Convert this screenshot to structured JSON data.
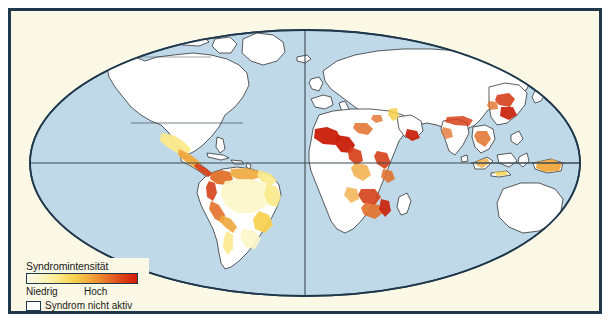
{
  "figure": {
    "background_color": "#ffffff",
    "frame_border_color": "#20384c",
    "paper_color": "#fbf8e6"
  },
  "map": {
    "projection": "elliptical world projection",
    "ocean_color": "#bfd9e8",
    "ocean_outline_color": "#20384c",
    "land_default_color": "#ffffff",
    "land_border_color": "#1a1a1a",
    "graticule_color": "#3c4a52",
    "graticule_lines": [
      "equator",
      "central meridian"
    ]
  },
  "legend": {
    "title": "Syndromintensität",
    "low_label": "Niedrig",
    "high_label": "Hoch",
    "inactive_label": "Syndrom nicht aktiv",
    "ramp_stops": [
      "#fdfbe8",
      "#fdf6c0",
      "#fbe98a",
      "#f7d451",
      "#f2a83a",
      "#e8762a",
      "#dd4318",
      "#d41b07"
    ],
    "inactive_color": "#ffffff"
  },
  "intensity_palette": {
    "none": "#ffffff",
    "very_low": "#fdf6c8",
    "low": "#fbe98a",
    "moderate": "#f7cf4a",
    "medium": "#f0a83c",
    "high": "#e2702a",
    "very_high": "#d6401a",
    "extreme": "#c81e08"
  },
  "regions": [
    {
      "name": "North America",
      "intensity": "none"
    },
    {
      "name": "Mexico",
      "intensity": "low"
    },
    {
      "name": "Central America",
      "intensity": "high"
    },
    {
      "name": "Colombia / Ecuador / Venezuela",
      "intensity": "very_high"
    },
    {
      "name": "Andes (Peru / Bolivia)",
      "intensity": "medium"
    },
    {
      "name": "Brazil coast",
      "intensity": "low"
    },
    {
      "name": "Amazon interior",
      "intensity": "very_low"
    },
    {
      "name": "Europe",
      "intensity": "none"
    },
    {
      "name": "Sahel / West Africa",
      "intensity": "extreme"
    },
    {
      "name": "Nigeria / Cameroon",
      "intensity": "extreme"
    },
    {
      "name": "Central Africa",
      "intensity": "high"
    },
    {
      "name": "East Africa highlands",
      "intensity": "high"
    },
    {
      "name": "Southeastern Africa",
      "intensity": "very_high"
    },
    {
      "name": "Arabian Peninsula / Yemen",
      "intensity": "very_high"
    },
    {
      "name": "Turkey / Levant",
      "intensity": "low"
    },
    {
      "name": "Himalayan foothills",
      "intensity": "high"
    },
    {
      "name": "Eastern China",
      "intensity": "very_high"
    },
    {
      "name": "Southeast Asia",
      "intensity": "high"
    },
    {
      "name": "Indonesia",
      "intensity": "medium"
    },
    {
      "name": "Papua New Guinea",
      "intensity": "medium"
    },
    {
      "name": "Australia",
      "intensity": "none"
    }
  ]
}
